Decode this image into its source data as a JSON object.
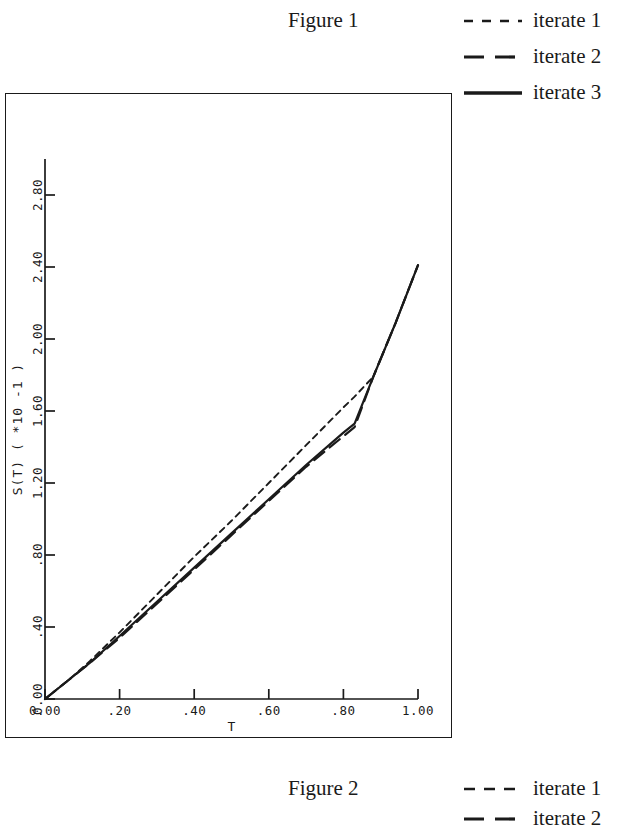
{
  "figures": {
    "top_caption": "Figure 1",
    "bottom_caption": "Figure 2"
  },
  "legend_top": {
    "items": [
      {
        "label": "iterate 1",
        "style": "short-dash",
        "color": "#1a1a1a"
      },
      {
        "label": "iterate 2",
        "style": "long-dash",
        "color": "#1a1a1a"
      },
      {
        "label": "iterate 3",
        "style": "solid",
        "color": "#1a1a1a"
      }
    ]
  },
  "legend_bottom": {
    "items": [
      {
        "label": "iterate 1",
        "style": "short-dash",
        "color": "#1a1a1a"
      },
      {
        "label": "iterate 2",
        "style": "long-dash",
        "color": "#1a1a1a"
      }
    ]
  },
  "chart_data": {
    "type": "line",
    "title": "Figure 1",
    "xlabel": "T",
    "ylabel": "S(T) ( *10 -1 )",
    "ylabel_parts": {
      "name": "S(T)",
      "open": "(",
      "mult": "*",
      "base": "10",
      "exp": "-1",
      "close": ")"
    },
    "xlim": [
      0.0,
      1.0
    ],
    "ylim": [
      0.0,
      3.0
    ],
    "grid": false,
    "legend_position": "top-right",
    "xticks": [
      0.0,
      0.2,
      0.4,
      0.6,
      0.8,
      1.0
    ],
    "xtick_labels": [
      "0.00",
      ".20",
      ".40",
      ".60",
      ".80",
      "1.00"
    ],
    "yticks": [
      0.0,
      0.4,
      0.8,
      1.2,
      1.6,
      2.0,
      2.4,
      2.8
    ],
    "ytick_labels": [
      "0.00",
      ".40",
      ".80",
      "1.20",
      "1.60",
      "2.00",
      "2.40",
      "2.80"
    ],
    "series": [
      {
        "name": "iterate 1",
        "style": "short-dash",
        "color": "#1a1a1a",
        "x": [
          0.0,
          0.06,
          0.12,
          0.2,
          0.3,
          0.4,
          0.5,
          0.6,
          0.7,
          0.8,
          0.83,
          0.88,
          0.94,
          1.0
        ],
        "y": [
          0.0,
          0.1,
          0.21,
          0.37,
          0.58,
          0.79,
          0.99,
          1.2,
          1.41,
          1.62,
          1.68,
          1.79,
          2.09,
          2.41
        ]
      },
      {
        "name": "iterate 2",
        "style": "long-dash",
        "color": "#1a1a1a",
        "x": [
          0.0,
          0.06,
          0.12,
          0.2,
          0.3,
          0.4,
          0.5,
          0.6,
          0.7,
          0.8,
          0.83,
          0.88,
          0.94,
          1.0
        ],
        "y": [
          0.0,
          0.1,
          0.2,
          0.34,
          0.53,
          0.72,
          0.91,
          1.1,
          1.29,
          1.46,
          1.51,
          1.79,
          2.09,
          2.41
        ]
      },
      {
        "name": "iterate 3",
        "style": "solid",
        "color": "#1a1a1a",
        "x": [
          0.0,
          0.06,
          0.12,
          0.2,
          0.3,
          0.4,
          0.5,
          0.6,
          0.7,
          0.8,
          0.83,
          0.88,
          0.94,
          1.0
        ],
        "y": [
          0.0,
          0.1,
          0.2,
          0.35,
          0.54,
          0.73,
          0.92,
          1.11,
          1.3,
          1.48,
          1.53,
          1.79,
          2.09,
          2.41
        ]
      }
    ]
  }
}
